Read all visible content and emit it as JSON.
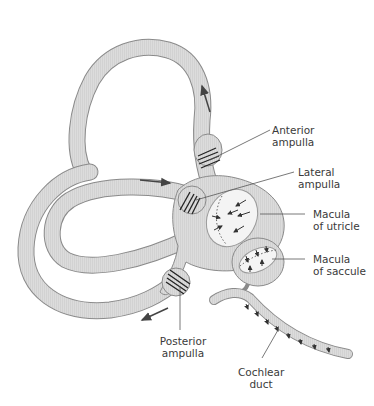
{
  "figure": {
    "colors": {
      "background": "#ffffff",
      "membrane_fill": "#d9d9d9",
      "membrane_outline": "#8a8a8a",
      "macula_fill": "#f4f4f4",
      "hair_lines": "#222222",
      "label_text": "#3a3a3a",
      "leader_lines": "#555555"
    }
  },
  "labels": {
    "anterior_ampulla": {
      "line1": "Anterior",
      "line2": "ampulla"
    },
    "lateral_ampulla": {
      "line1": "Lateral",
      "line2": "ampulla"
    },
    "macula_utricle": {
      "line1": "Macula",
      "line2": "of utricle"
    },
    "macula_saccule": {
      "line1": "Macula",
      "line2": "of saccule"
    },
    "posterior_ampulla": {
      "line1": "Posterior",
      "line2": "ampulla"
    },
    "cochlear_duct": {
      "line1": "Cochlear",
      "line2": "duct"
    }
  },
  "arrows": [
    {
      "id": "anterior-flow-arrow",
      "direction": "up"
    },
    {
      "id": "lateral-flow-arrow",
      "direction": "right"
    },
    {
      "id": "posterior-flow-arrow",
      "direction": "down-left"
    }
  ]
}
